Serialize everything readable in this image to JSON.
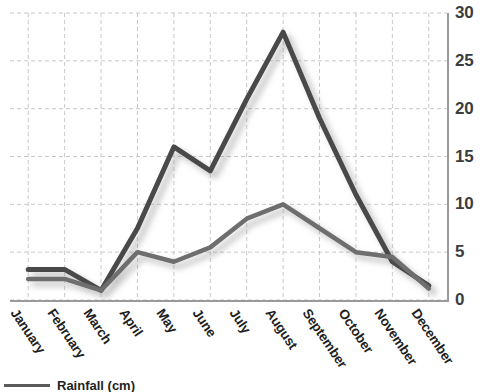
{
  "chart_data": {
    "type": "line",
    "title": "",
    "xlabel": "",
    "ylabel": "",
    "ylim": [
      0,
      30
    ],
    "yticks": [
      0,
      5,
      10,
      15,
      20,
      25,
      30
    ],
    "grid": true,
    "legend_position": "bottom-left",
    "categories": [
      "January",
      "February",
      "March",
      "April",
      "May",
      "June",
      "July",
      "August",
      "September",
      "October",
      "November",
      "December"
    ],
    "series": [
      {
        "name": "Rainfall (cm)",
        "color": "#4a4a4a",
        "values": [
          3.2,
          3.2,
          1.0,
          7.5,
          16.0,
          13.5,
          21.0,
          28.0,
          19.0,
          11.0,
          4.0,
          1.5
        ]
      },
      {
        "name": "Rainfall (cm)",
        "color": "#6e6e6e",
        "values": [
          2.2,
          2.2,
          1.0,
          5.0,
          4.0,
          5.5,
          8.5,
          10.0,
          7.5,
          5.0,
          4.5,
          1.2
        ]
      }
    ]
  },
  "legend": {
    "label": "Rainfall (cm)",
    "swatch_color": "#5a5a5a"
  },
  "axes": {
    "y_tick_labels": [
      "0",
      "5",
      "10",
      "15",
      "20",
      "25",
      "30"
    ],
    "axis_color": "#9a9a9a",
    "grid_color": "#c8c8c8"
  }
}
